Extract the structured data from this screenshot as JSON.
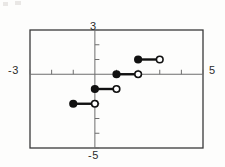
{
  "figure": {
    "title": "",
    "axis_labels": {
      "top": "3",
      "left": "-3",
      "right": "5",
      "bottom": "-5"
    }
  },
  "chart_data": {
    "type": "line",
    "subtype": "step-function",
    "title": "",
    "xlabel": "",
    "ylabel": "",
    "xlim": [
      -3,
      5
    ],
    "ylim": [
      -5,
      3
    ],
    "xticks": [
      -3,
      -2,
      -1,
      0,
      1,
      2,
      3,
      4,
      5
    ],
    "yticks": [
      -5,
      -4,
      -3,
      -2,
      -1,
      0,
      1,
      2,
      3
    ],
    "xtick_labels": [
      "-3",
      "",
      "",
      "",
      "",
      "",
      "",
      "",
      "5"
    ],
    "ytick_labels": [
      "-5",
      "",
      "",
      "",
      "",
      "",
      "",
      "",
      "3"
    ],
    "grid": false,
    "legend": null,
    "axes": {
      "x_axis_at_y": 0,
      "y_axis_at_x": 0,
      "frame": true
    },
    "series": [
      {
        "name": "step-segments",
        "marker_left": "filled-circle",
        "marker_right": "open-circle",
        "color": "#111111",
        "segments": [
          {
            "y": 1,
            "x_start": 2,
            "x_end": 3,
            "left_closed": true,
            "right_closed": false
          },
          {
            "y": 0,
            "x_start": 1,
            "x_end": 2,
            "left_closed": true,
            "right_closed": false
          },
          {
            "y": -1,
            "x_start": 0,
            "x_end": 1,
            "left_closed": true,
            "right_closed": false
          },
          {
            "y": -2,
            "x_start": -1,
            "x_end": 0,
            "left_closed": true,
            "right_closed": false
          }
        ]
      }
    ]
  },
  "colors": {
    "frame": "#3a3a3a",
    "axis": "#6e6e6e",
    "data": "#111111",
    "text": "#2b2b2b",
    "background": "#fdfdfc"
  }
}
